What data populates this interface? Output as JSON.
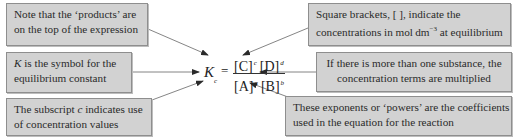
{
  "diagram": {
    "equation": {
      "symbol": "K",
      "subscript": "c",
      "equals": "=",
      "numerator": [
        {
          "species": "[C]",
          "exponent": "c"
        },
        {
          "species": "[D]",
          "exponent": "d"
        }
      ],
      "denominator": [
        {
          "species": "[A]",
          "exponent": "a"
        },
        {
          "species": "[B]",
          "exponent": "b"
        }
      ]
    },
    "annotations": [
      {
        "id": "products",
        "lines": [
          "Note that the ‘products’ are",
          "on the top of the expression"
        ]
      },
      {
        "id": "k-symbol",
        "italic_prefix": "K",
        "lines": [
          " is the symbol for the",
          "equilibrium constant"
        ]
      },
      {
        "id": "subscript-c",
        "lines": [
          "The subscript ",
          "c",
          " indicates use",
          "of concentration values"
        ]
      },
      {
        "id": "square-brackets",
        "lines": [
          "Square brackets, [   ], indicate the",
          "concentrations in mol dm",
          "−3",
          " at equilibrium"
        ]
      },
      {
        "id": "multiplied",
        "lines": [
          "If there is more than one substance, the",
          "concentration terms are multiplied"
        ]
      },
      {
        "id": "exponents",
        "lines": [
          "These exponents or ‘powers’ are the coefficients",
          "used in the equation for the reaction"
        ]
      }
    ],
    "colors": {
      "box_fill": "#d2d2d2",
      "box_border": "#8e8e8e",
      "arrow": "#555555",
      "text": "#2a2a2a"
    }
  }
}
